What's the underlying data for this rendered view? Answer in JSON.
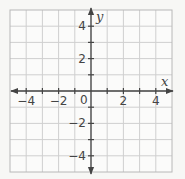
{
  "chart_data": {
    "type": "scatter",
    "title": "",
    "xlabel": "x",
    "ylabel": "y",
    "xlim": [
      -5,
      5
    ],
    "ylim": [
      -5,
      5
    ],
    "grid": true,
    "grid_step": 1,
    "x_tick_labels": [
      "−4",
      "−2",
      "2",
      "4"
    ],
    "x_tick_values": [
      -4,
      -2,
      2,
      4
    ],
    "y_tick_labels": [
      "4",
      "2",
      "−2",
      "−4"
    ],
    "y_tick_values": [
      4,
      2,
      -2,
      -4
    ],
    "origin_label": "0",
    "series": []
  },
  "colors": {
    "background": "#f7f7f5",
    "grid": "#cfcfcf",
    "border": "#b8b8b8",
    "axis": "#444444",
    "text": "#444444"
  }
}
